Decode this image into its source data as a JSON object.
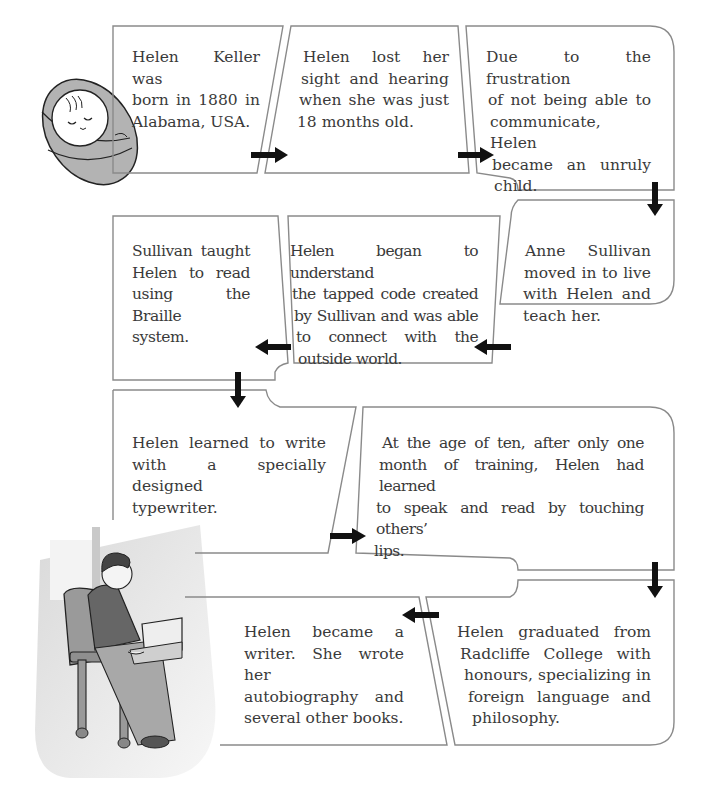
{
  "diagram": {
    "title": "",
    "type": "flowchart-timeline",
    "colors": {
      "box_border": "#8a8a8a",
      "arrow": "#111111",
      "text": "#3a3a3a",
      "illustration_fill": "#b5b5b5"
    },
    "steps": [
      {
        "id": 1,
        "lines": [
          "Helen Keller was",
          "born in 1880 in",
          "Alabama, USA."
        ]
      },
      {
        "id": 2,
        "lines": [
          "Helen lost her",
          "sight and hearing",
          "when she was just",
          "18 months old."
        ]
      },
      {
        "id": 3,
        "lines": [
          "Due to the frustration",
          "of not being able to",
          "communicate, Helen",
          "became an unruly",
          "child."
        ]
      },
      {
        "id": 4,
        "lines": [
          "Anne Sullivan",
          "moved in to live",
          "with Helen and",
          "teach her."
        ]
      },
      {
        "id": 5,
        "lines": [
          "Helen began to understand",
          "the tapped code created",
          "by Sullivan and was able",
          "to connect with the",
          "outside world."
        ]
      },
      {
        "id": 6,
        "lines": [
          "Sullivan taught",
          "Helen to read",
          "using the Braille",
          "system."
        ]
      },
      {
        "id": 7,
        "lines": [
          "Helen learned to write",
          "with a specially designed",
          "typewriter."
        ]
      },
      {
        "id": 8,
        "lines": [
          "At the age of ten, after only one",
          "month of training, Helen had learned",
          "to speak and read by touching others’",
          "lips."
        ]
      },
      {
        "id": 9,
        "lines": [
          "Helen graduated from",
          "Radcliffe College with",
          "honours, specializing in",
          "foreign language and",
          "philosophy."
        ]
      },
      {
        "id": 10,
        "lines": [
          "Helen became a",
          "writer. She wrote her",
          "autobiography and",
          "several other books."
        ]
      }
    ],
    "icons": {
      "baby": "swaddled-baby-illustration",
      "reader": "woman-reading-braille-illustration"
    }
  }
}
